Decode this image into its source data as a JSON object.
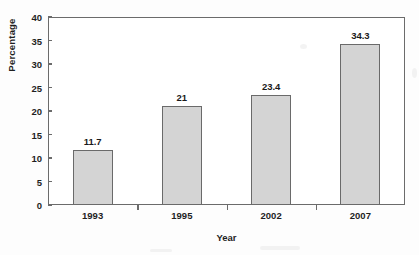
{
  "chart_data": {
    "type": "bar",
    "title": "",
    "xlabel": "Year",
    "ylabel": "Percentage",
    "categories": [
      "1993",
      "1995",
      "2002",
      "2007"
    ],
    "values": [
      11.7,
      21,
      23.4,
      34.3
    ],
    "value_labels": [
      "11.7",
      "21",
      "23.4",
      "34.3"
    ],
    "ylim": [
      0,
      40
    ],
    "ytick_step": 5,
    "yticks": [
      "40",
      "35",
      "30",
      "25",
      "20",
      "15",
      "10",
      "5",
      "0"
    ],
    "grid": false,
    "legend": null,
    "legend_position": "none",
    "colors": {
      "bar_fill": "#d4d4d4",
      "bar_border": "#6a6a6a",
      "axis": "#6b6b6b",
      "text": "#1f1f1f",
      "background": "#ffffff"
    }
  }
}
